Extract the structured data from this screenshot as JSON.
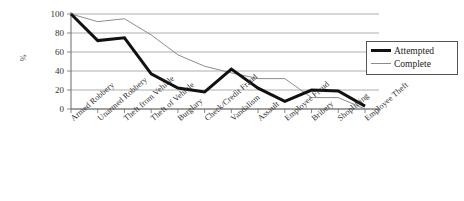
{
  "chart_data": {
    "type": "line",
    "title": "",
    "xlabel": "",
    "ylabel": "%",
    "ylim": [
      0,
      100
    ],
    "yticks": [
      0,
      20,
      40,
      60,
      80,
      100
    ],
    "grid": true,
    "legend_position": "right",
    "categories": [
      "Armed Robbery",
      "Unarmed Robbery",
      "Theft from Vehicle",
      "Theft of Vehicle",
      "Burglary",
      "Check/Credit Fraud",
      "Vandalism",
      "Assault",
      "Employee Fraud",
      "Bribery",
      "Shoplifting",
      "Employee Theft"
    ],
    "series": [
      {
        "name": "Attempted",
        "color": "#111111",
        "width": 3,
        "values": [
          100,
          72,
          75,
          37,
          22,
          18,
          42,
          22,
          8,
          20,
          19,
          3
        ]
      },
      {
        "name": "Complete",
        "color": "#8c8c8c",
        "width": 1,
        "values": [
          100,
          92,
          95,
          78,
          57,
          45,
          38,
          32,
          32,
          12,
          12,
          0
        ]
      }
    ]
  },
  "legend": {
    "items": [
      {
        "label": "Attempted"
      },
      {
        "label": "Complete"
      }
    ]
  },
  "axis": {
    "y_axis_title": "%",
    "tick_labels": [
      "100",
      "80",
      "60",
      "40",
      "20",
      "0"
    ]
  }
}
